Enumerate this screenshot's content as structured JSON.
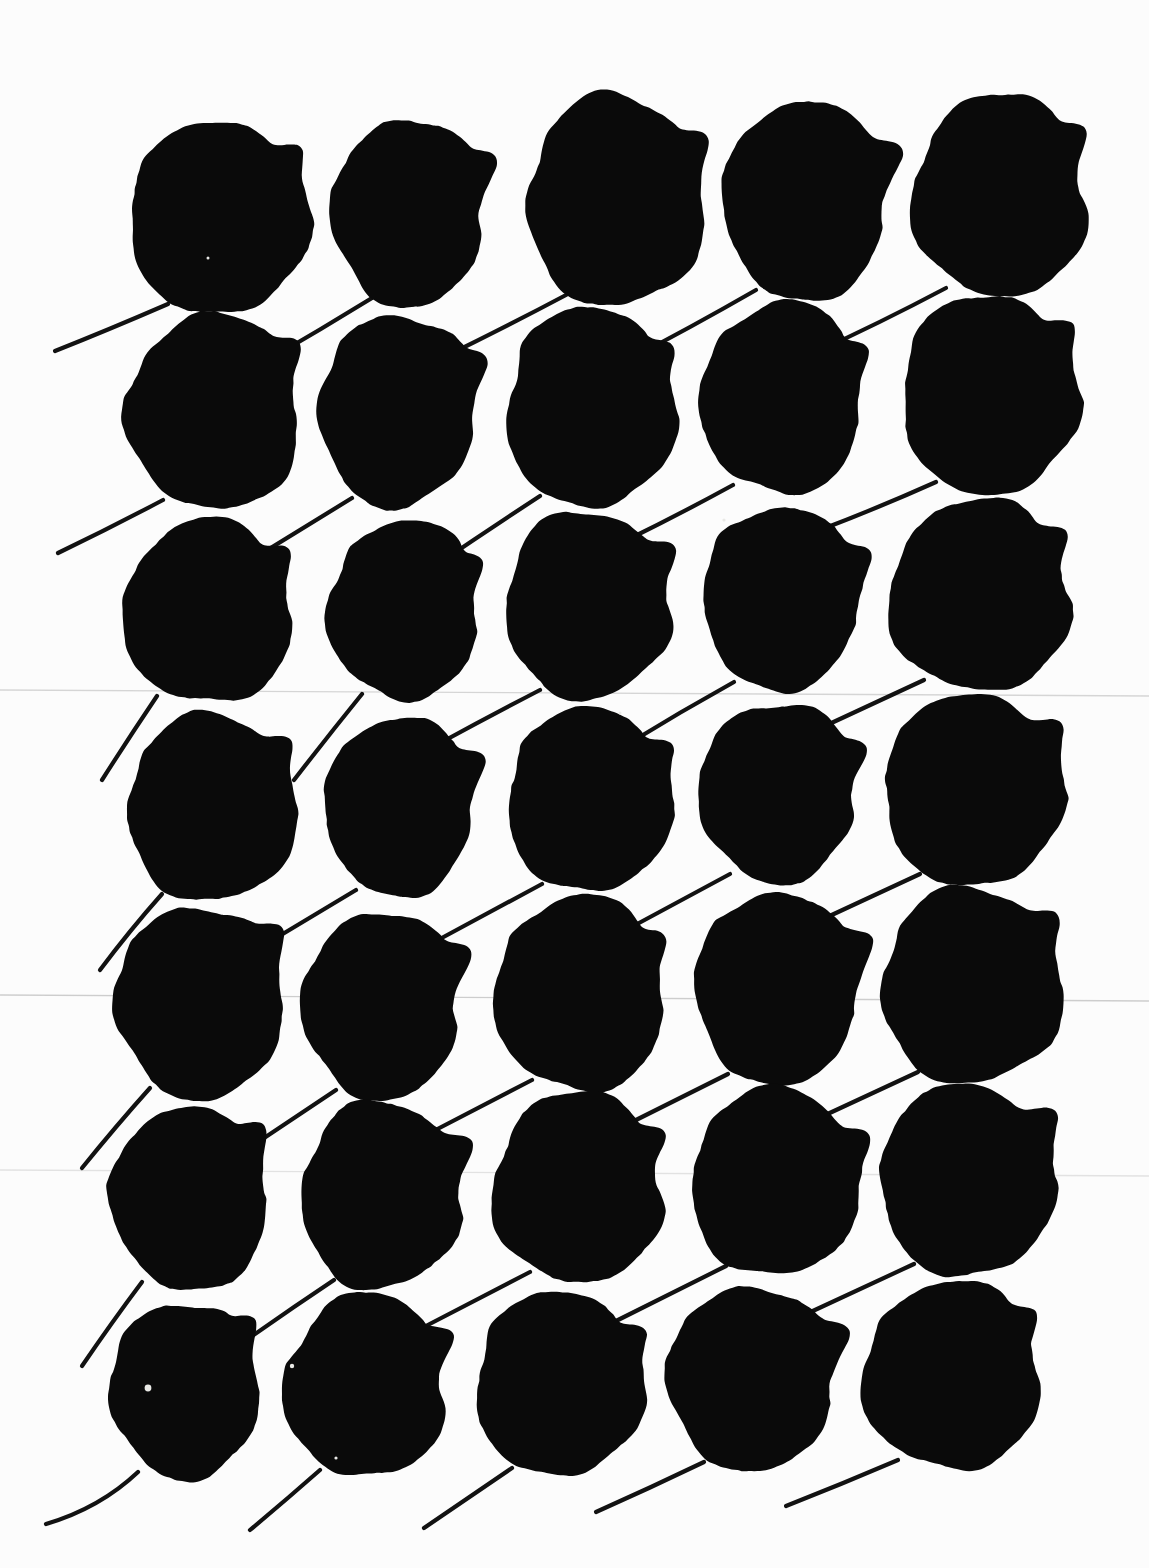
{
  "image": {
    "title": "Leaf Silhouette Specimen Sheet",
    "kind": "scanned-botanical-plate",
    "width": 1149,
    "height": 1568,
    "background_color": "#fcfcfc",
    "ink_color": "#0a0a0a",
    "stem_color": "#121212",
    "specimen_count": 35,
    "rows": 7,
    "columns": 5,
    "description": "Thirty-five near-circular black leaf silhouettes arranged in a seven-row by five-column grid on off-white paper. Each blade has a small pointed apex tip at its upper right and a thin curved petiole trailing to the lower left."
  },
  "grid": {
    "row_tops": [
      118,
      312,
      512,
      712,
      908,
      1108,
      1300
    ],
    "column_lefts": [
      120,
      312,
      505,
      690,
      882
    ]
  },
  "artifacts": {
    "scan_lines": [
      {
        "y": 690,
        "opacity": 0.18
      },
      {
        "y": 995,
        "opacity": 0.22
      },
      {
        "y": 1170,
        "opacity": 0.12
      }
    ],
    "specks": [
      {
        "x": 148,
        "y": 1388,
        "r": 3.4
      },
      {
        "x": 292,
        "y": 1366,
        "r": 2.2
      },
      {
        "x": 336,
        "y": 1458,
        "r": 1.6
      },
      {
        "x": 620,
        "y": 713,
        "r": 1.5
      },
      {
        "x": 208,
        "y": 258,
        "r": 1.5
      },
      {
        "x": 724,
        "y": 520,
        "r": 1.6
      }
    ]
  },
  "chart_data": {
    "type": "scatter",
    "xlabel": "",
    "ylabel": "",
    "grid": false,
    "legend": "none",
    "xlim": [
      0,
      1149
    ],
    "ylim": [
      0,
      1568
    ],
    "note": "Each datum is one pressed leaf silhouette: centre position, blade radii, apex-tip angle and petiole end point, read off the scan in pixel coordinates.",
    "leaves": [
      {
        "id": "r1c1",
        "row": 1,
        "col": 1,
        "cx": 219,
        "cy": 218,
        "rx": 92,
        "ry": 96,
        "rot": -4,
        "tip": 36,
        "stem": [
          168,
          304,
          108,
          330,
          55,
          351
        ],
        "seed": 11
      },
      {
        "id": "r1c2",
        "row": 1,
        "col": 2,
        "cx": 409,
        "cy": 212,
        "rx": 78,
        "ry": 94,
        "rot": 3,
        "tip": 30,
        "stem": [
          372,
          298,
          320,
          330,
          268,
          360
        ],
        "seed": 23
      },
      {
        "id": "r1c3",
        "row": 1,
        "col": 3,
        "cx": 616,
        "cy": 201,
        "rx": 90,
        "ry": 106,
        "rot": -3,
        "tip": 28,
        "stem": [
          566,
          295,
          500,
          330,
          442,
          358
        ],
        "seed": 37
      },
      {
        "id": "r1c4",
        "row": 1,
        "col": 4,
        "cx": 806,
        "cy": 200,
        "rx": 84,
        "ry": 100,
        "rot": 2,
        "tip": 26,
        "stem": [
          756,
          290,
          690,
          328,
          626,
          361
        ],
        "seed": 41
      },
      {
        "id": "r1c5",
        "row": 1,
        "col": 5,
        "cx": 1000,
        "cy": 196,
        "rx": 88,
        "ry": 102,
        "rot": -2,
        "tip": 32,
        "stem": [
          946,
          288,
          878,
          324,
          816,
          352
        ],
        "seed": 53
      },
      {
        "id": "r2c1",
        "row": 2,
        "col": 1,
        "cx": 214,
        "cy": 412,
        "rx": 88,
        "ry": 98,
        "rot": -3,
        "tip": 33,
        "stem": [
          163,
          500,
          110,
          528,
          58,
          553
        ],
        "seed": 61
      },
      {
        "id": "r2c2",
        "row": 2,
        "col": 2,
        "cx": 398,
        "cy": 410,
        "rx": 80,
        "ry": 96,
        "rot": 4,
        "tip": 29,
        "stem": [
          352,
          498,
          300,
          530,
          248,
          562
        ],
        "seed": 67
      },
      {
        "id": "r2c3",
        "row": 2,
        "col": 3,
        "cx": 591,
        "cy": 408,
        "rx": 86,
        "ry": 100,
        "rot": -2,
        "tip": 31,
        "stem": [
          540,
          496,
          488,
          530,
          438,
          564
        ],
        "seed": 73
      },
      {
        "id": "r2c4",
        "row": 2,
        "col": 4,
        "cx": 782,
        "cy": 398,
        "rx": 82,
        "ry": 96,
        "rot": 1,
        "tip": 27,
        "stem": [
          733,
          485,
          680,
          514,
          627,
          540
        ],
        "seed": 79
      },
      {
        "id": "r2c5",
        "row": 2,
        "col": 5,
        "cx": 990,
        "cy": 395,
        "rx": 90,
        "ry": 100,
        "rot": -4,
        "tip": 34,
        "stem": [
          936,
          482,
          878,
          508,
          820,
          530
        ],
        "seed": 83
      },
      {
        "id": "r3c1",
        "row": 3,
        "col": 1,
        "cx": 208,
        "cy": 612,
        "rx": 86,
        "ry": 92,
        "rot": -2,
        "tip": 34,
        "stem": [
          157,
          696,
          130,
          736,
          102,
          780
        ],
        "seed": 89
      },
      {
        "id": "r3c2",
        "row": 3,
        "col": 2,
        "cx": 404,
        "cy": 610,
        "rx": 76,
        "ry": 90,
        "rot": 3,
        "tip": 30,
        "stem": [
          362,
          694,
          328,
          736,
          294,
          780
        ],
        "seed": 97
      },
      {
        "id": "r3c3",
        "row": 3,
        "col": 3,
        "cx": 588,
        "cy": 605,
        "rx": 84,
        "ry": 94,
        "rot": -3,
        "tip": 28,
        "stem": [
          540,
          690,
          490,
          716,
          442,
          742
        ],
        "seed": 101
      },
      {
        "id": "r3c4",
        "row": 3,
        "col": 4,
        "cx": 782,
        "cy": 598,
        "rx": 80,
        "ry": 92,
        "rot": 2,
        "tip": 26,
        "stem": [
          734,
          682,
          680,
          712,
          628,
          744
        ],
        "seed": 103
      },
      {
        "id": "r3c5",
        "row": 3,
        "col": 5,
        "cx": 980,
        "cy": 596,
        "rx": 92,
        "ry": 96,
        "rot": -3,
        "tip": 33,
        "stem": [
          924,
          680,
          868,
          706,
          812,
          732
        ],
        "seed": 107
      },
      {
        "id": "r4c1",
        "row": 4,
        "col": 1,
        "cx": 212,
        "cy": 808,
        "rx": 86,
        "ry": 94,
        "rot": -4,
        "tip": 35,
        "stem": [
          162,
          894,
          130,
          930,
          100,
          970
        ],
        "seed": 109
      },
      {
        "id": "r4c2",
        "row": 4,
        "col": 2,
        "cx": 400,
        "cy": 806,
        "rx": 76,
        "ry": 90,
        "rot": 3,
        "tip": 29,
        "stem": [
          356,
          890,
          306,
          920,
          256,
          950
        ],
        "seed": 113
      },
      {
        "id": "r4c3",
        "row": 4,
        "col": 3,
        "cx": 590,
        "cy": 800,
        "rx": 84,
        "ry": 92,
        "rot": -2,
        "tip": 30,
        "stem": [
          542,
          884,
          490,
          912,
          438,
          940
        ],
        "seed": 127
      },
      {
        "id": "r4c4",
        "row": 4,
        "col": 4,
        "cx": 778,
        "cy": 792,
        "rx": 80,
        "ry": 90,
        "rot": 2,
        "tip": 26,
        "stem": [
          730,
          874,
          678,
          902,
          626,
          930
        ],
        "seed": 131
      },
      {
        "id": "r4c5",
        "row": 4,
        "col": 5,
        "cx": 974,
        "cy": 790,
        "rx": 92,
        "ry": 96,
        "rot": -3,
        "tip": 34,
        "stem": [
          920,
          874,
          864,
          900,
          808,
          926
        ],
        "seed": 137
      },
      {
        "id": "r5c1",
        "row": 5,
        "col": 1,
        "cx": 200,
        "cy": 1002,
        "rx": 86,
        "ry": 96,
        "rot": -3,
        "tip": 36,
        "stem": [
          150,
          1088,
          116,
          1126,
          82,
          1168
        ],
        "seed": 139
      },
      {
        "id": "r5c2",
        "row": 5,
        "col": 2,
        "cx": 382,
        "cy": 1005,
        "rx": 80,
        "ry": 94,
        "rot": 3,
        "tip": 30,
        "stem": [
          336,
          1090,
          288,
          1122,
          240,
          1154
        ],
        "seed": 149
      },
      {
        "id": "r5c3",
        "row": 5,
        "col": 3,
        "cx": 580,
        "cy": 994,
        "rx": 86,
        "ry": 98,
        "rot": -2,
        "tip": 29,
        "stem": [
          532,
          1080,
          478,
          1108,
          424,
          1136
        ],
        "seed": 151
      },
      {
        "id": "r5c4",
        "row": 5,
        "col": 4,
        "cx": 778,
        "cy": 988,
        "rx": 84,
        "ry": 96,
        "rot": 2,
        "tip": 27,
        "stem": [
          728,
          1074,
          672,
          1102,
          616,
          1130
        ],
        "seed": 157
      },
      {
        "id": "r5c5",
        "row": 5,
        "col": 5,
        "cx": 972,
        "cy": 986,
        "rx": 92,
        "ry": 98,
        "rot": -3,
        "tip": 35,
        "stem": [
          918,
          1072,
          862,
          1098,
          806,
          1124
        ],
        "seed": 163
      },
      {
        "id": "r6c1",
        "row": 6,
        "col": 1,
        "cx": 190,
        "cy": 1198,
        "rx": 80,
        "ry": 92,
        "rot": -4,
        "tip": 37,
        "stem": [
          142,
          1282,
          112,
          1322,
          82,
          1366
        ],
        "seed": 167
      },
      {
        "id": "r6c2",
        "row": 6,
        "col": 2,
        "cx": 382,
        "cy": 1195,
        "rx": 82,
        "ry": 94,
        "rot": 3,
        "tip": 30,
        "stem": [
          334,
          1280,
          286,
          1312,
          238,
          1346
        ],
        "seed": 173
      },
      {
        "id": "r6c3",
        "row": 6,
        "col": 3,
        "cx": 578,
        "cy": 1188,
        "rx": 86,
        "ry": 96,
        "rot": -2,
        "tip": 28,
        "stem": [
          530,
          1272,
          476,
          1300,
          422,
          1328
        ],
        "seed": 179
      },
      {
        "id": "r6c4",
        "row": 6,
        "col": 4,
        "cx": 776,
        "cy": 1182,
        "rx": 86,
        "ry": 94,
        "rot": 2,
        "tip": 27,
        "stem": [
          726,
          1266,
          670,
          1294,
          614,
          1322
        ],
        "seed": 181
      },
      {
        "id": "r6c5",
        "row": 6,
        "col": 5,
        "cx": 968,
        "cy": 1180,
        "rx": 90,
        "ry": 96,
        "rot": -3,
        "tip": 34,
        "stem": [
          914,
          1264,
          858,
          1290,
          802,
          1316
        ],
        "seed": 191
      },
      {
        "id": "r7c1",
        "row": 7,
        "col": 1,
        "cx": 185,
        "cy": 1390,
        "rx": 76,
        "ry": 88,
        "rot": -3,
        "tip": 38,
        "stem": [
          138,
          1472,
          100,
          1508,
          46,
          1524
        ],
        "seed": 193
      },
      {
        "id": "r7c2",
        "row": 7,
        "col": 2,
        "cx": 366,
        "cy": 1386,
        "rx": 82,
        "ry": 92,
        "rot": 3,
        "tip": 31,
        "stem": [
          320,
          1470,
          286,
          1500,
          250,
          1530
        ],
        "seed": 197
      },
      {
        "id": "r7c3",
        "row": 7,
        "col": 3,
        "cx": 560,
        "cy": 1384,
        "rx": 86,
        "ry": 92,
        "rot": -2,
        "tip": 29,
        "stem": [
          512,
          1468,
          468,
          1498,
          424,
          1528
        ],
        "seed": 199
      },
      {
        "id": "r7c4",
        "row": 7,
        "col": 4,
        "cx": 752,
        "cy": 1378,
        "rx": 86,
        "ry": 92,
        "rot": 2,
        "tip": 27,
        "stem": [
          704,
          1462,
          650,
          1488,
          596,
          1512
        ],
        "seed": 211
      },
      {
        "id": "r7c5",
        "row": 7,
        "col": 5,
        "cx": 952,
        "cy": 1376,
        "rx": 90,
        "ry": 94,
        "rot": -3,
        "tip": 33,
        "stem": [
          898,
          1460,
          842,
          1484,
          786,
          1506
        ],
        "seed": 223
      }
    ]
  }
}
